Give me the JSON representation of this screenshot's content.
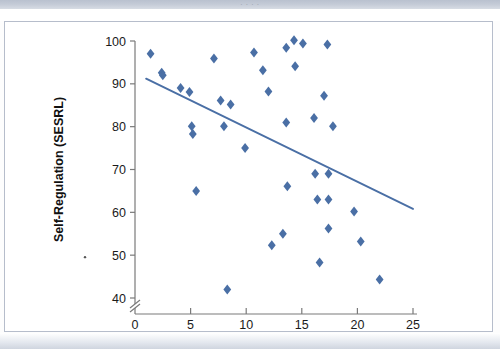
{
  "page": {
    "top_band_text": "· · · ·",
    "background_color": "#ffffff",
    "frame_border_color": "#b6bdcb"
  },
  "chart_data": {
    "type": "scatter",
    "title": "",
    "xlabel": "Stigma Sensitivity (RS-race)",
    "ylabel": "Self-Regulation (SESRL)",
    "xlim": [
      0,
      25
    ],
    "ylim": [
      40,
      100
    ],
    "xticks": [
      0,
      5,
      10,
      15,
      20,
      25
    ],
    "yticks": [
      40,
      50,
      60,
      70,
      80,
      90,
      100
    ],
    "xtick_labels": [
      "0",
      "5",
      "10",
      "15",
      "20",
      "25"
    ],
    "ytick_labels": [
      "40",
      "50",
      "60",
      "70",
      "80",
      "90",
      "100"
    ],
    "grid": false,
    "legend": null,
    "axis_break": {
      "axis": "y",
      "below": 40,
      "symbol": "//"
    },
    "marker": {
      "shape": "diamond",
      "color": "#4a6fa5",
      "size": 5
    },
    "points": [
      [
        1.4,
        97.0
      ],
      [
        2.4,
        92.6
      ],
      [
        2.5,
        92.0
      ],
      [
        4.1,
        89.0
      ],
      [
        4.9,
        88.1
      ],
      [
        5.1,
        80.1
      ],
      [
        5.2,
        78.3
      ],
      [
        5.5,
        65.0
      ],
      [
        7.1,
        95.9
      ],
      [
        7.7,
        86.1
      ],
      [
        8.0,
        80.1
      ],
      [
        8.3,
        42.0
      ],
      [
        8.6,
        85.2
      ],
      [
        9.9,
        75.0
      ],
      [
        10.7,
        97.3
      ],
      [
        11.5,
        93.2
      ],
      [
        12.0,
        88.2
      ],
      [
        12.3,
        52.3
      ],
      [
        13.3,
        55.0
      ],
      [
        13.6,
        98.4
      ],
      [
        13.6,
        81.0
      ],
      [
        13.7,
        66.1
      ],
      [
        14.3,
        100.2
      ],
      [
        14.4,
        94.1
      ],
      [
        15.1,
        99.4
      ],
      [
        16.1,
        82.0
      ],
      [
        16.2,
        69.0
      ],
      [
        16.4,
        63.0
      ],
      [
        16.6,
        48.3
      ],
      [
        17.3,
        99.2
      ],
      [
        17.0,
        87.2
      ],
      [
        17.4,
        69.0
      ],
      [
        17.4,
        63.0
      ],
      [
        17.4,
        56.2
      ],
      [
        17.8,
        80.1
      ],
      [
        19.7,
        60.2
      ],
      [
        20.3,
        53.2
      ],
      [
        22.0,
        44.3
      ]
    ],
    "trendline": {
      "type": "linear",
      "x_start": 1.0,
      "y_start": 91.2,
      "x_end": 25.0,
      "y_end": 60.8,
      "color": "#4a6fa5",
      "direction": "negative"
    }
  }
}
